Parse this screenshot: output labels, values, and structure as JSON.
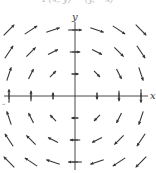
{
  "caption": "F(x, y) = ⟨y, −x⟩",
  "chart_data": {
    "type": "vector-field",
    "title": "F(x, y) = ⟨y, −x⟩",
    "xlabel": "x",
    "ylabel": "y",
    "grid": false,
    "x_ticks": [
      -3,
      -2,
      -1,
      1,
      2,
      3
    ],
    "y_ticks": [
      -3,
      -2,
      -1,
      1,
      2,
      3
    ],
    "tick_label_left": "–",
    "xlim": [
      -3.4,
      3.4
    ],
    "ylim": [
      -3.4,
      3.4
    ],
    "field": {
      "u": "y",
      "v": "-x"
    },
    "sample_points": [
      -3,
      -2,
      -1,
      0,
      1,
      2,
      3
    ],
    "colors": {
      "arrows": "#333333",
      "axes": "#333333"
    }
  }
}
